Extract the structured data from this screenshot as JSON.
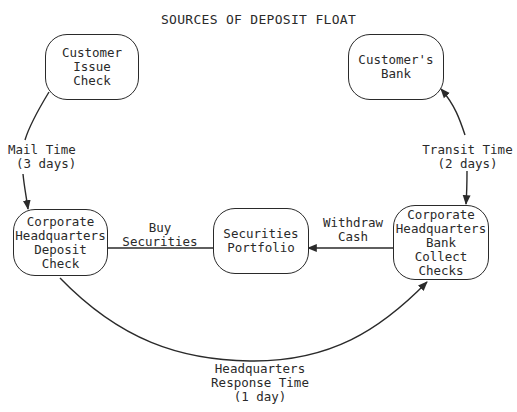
{
  "title": "SOURCES OF DEPOSIT FLOAT",
  "nodes": {
    "customer_issue_check": {
      "lines": [
        "Customer",
        "Issue",
        "Check"
      ]
    },
    "customers_bank": {
      "lines": [
        "Customer's",
        "Bank"
      ]
    },
    "corp_hq_deposit_check": {
      "lines": [
        "Corporate",
        "Headquarters",
        "Deposit",
        "Check"
      ]
    },
    "securities_portfolio": {
      "lines": [
        "Securities",
        "Portfolio"
      ]
    },
    "corp_hq_bank_collect_checks": {
      "lines": [
        "Corporate",
        "Headquarters",
        "Bank",
        "Collect",
        "Checks"
      ]
    }
  },
  "edges": {
    "mail_time": {
      "lines": [
        "Mail Time",
        "(3 days)"
      ]
    },
    "transit_time": {
      "lines": [
        "Transit Time",
        "(2 days)"
      ]
    },
    "buy_securities": {
      "lines": [
        "Buy",
        "Securities"
      ]
    },
    "withdraw_cash": {
      "lines": [
        "Withdraw",
        "Cash"
      ]
    },
    "hq_response_time": {
      "lines": [
        "Headquarters",
        "Response Time",
        "(1 day)"
      ]
    }
  },
  "colors": {
    "ink": "#2a2a2a",
    "background": "#ffffff"
  }
}
